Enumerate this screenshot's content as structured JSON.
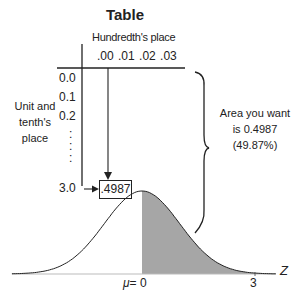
{
  "title": "Table",
  "table": {
    "column_header": "Hundredth's place",
    "columns": [
      ".00",
      ".01",
      ".02",
      ".03"
    ],
    "row_header": "Unit and tenth's place",
    "row_header_lines": [
      "Unit and",
      "tenth's",
      "place"
    ],
    "rows": [
      "0.0",
      "0.1",
      "0.2",
      ":",
      ":",
      "3.0"
    ],
    "highlighted_value": ".4987"
  },
  "annotation": {
    "lines": [
      "Area you want",
      "is 0.4987",
      "(49.87%)"
    ]
  },
  "curve": {
    "type": "normal-distribution",
    "mean_label": "μ",
    "mean_equals": "= 0",
    "z_value_label": "3",
    "axis_label": "Z",
    "shaded_region": "from 0 to 3",
    "shade_color": "#a6a6a6"
  }
}
